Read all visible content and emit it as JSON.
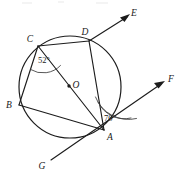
{
  "figure": {
    "shape": "circle",
    "center_label": "O",
    "points": [
      {
        "id": "A",
        "label": "A",
        "x": 104,
        "y": 130,
        "label_x": 110,
        "label_y": 140,
        "on_circle": true
      },
      {
        "id": "B",
        "label": "B",
        "x": 19,
        "y": 105,
        "label_x": 9,
        "label_y": 108,
        "on_circle": true
      },
      {
        "id": "C",
        "label": "C",
        "x": 38,
        "y": 46,
        "label_x": 30,
        "label_y": 42,
        "on_circle": true
      },
      {
        "id": "D",
        "label": "D",
        "x": 89,
        "y": 41,
        "label_x": 85,
        "label_y": 35,
        "on_circle": true
      },
      {
        "id": "O",
        "label": "O",
        "x": 69,
        "y": 86,
        "label_x": 74,
        "label_y": 85,
        "on_circle": false
      },
      {
        "id": "E",
        "label": "E",
        "x": 130,
        "y": 14,
        "label_x": 134,
        "label_y": 13,
        "on_circle": false
      },
      {
        "id": "F",
        "label": "F",
        "x": 164,
        "y": 81,
        "label_x": 170,
        "label_y": 79,
        "on_circle": false
      },
      {
        "id": "G",
        "label": "G",
        "x": 51,
        "y": 160,
        "label_x": 42,
        "label_y": 166,
        "on_circle": false
      }
    ],
    "circle": {
      "cx": 70,
      "cy": 87,
      "r": 51
    },
    "segments": [
      {
        "name": "chord-CD",
        "from": "C",
        "to": "D"
      },
      {
        "name": "chord-CB",
        "from": "C",
        "to": "B"
      },
      {
        "name": "chord-CA-diameter",
        "from": "C",
        "to": "A"
      },
      {
        "name": "chord-DA",
        "from": "D",
        "to": "A"
      },
      {
        "name": "chord-BA",
        "from": "B",
        "to": "A"
      }
    ],
    "rays": [
      {
        "name": "ray-D-to-E",
        "from": "D",
        "to": "E",
        "arrow": true
      },
      {
        "name": "ray-G-through-A-to-F",
        "from": "G",
        "to": "F",
        "arrow": true
      }
    ],
    "angles": [
      {
        "name": "angle-at-C",
        "vertex": "C",
        "value": "52",
        "unit": "°",
        "label": "52°",
        "label_x": 42,
        "label_y": 60,
        "arcs": 1
      },
      {
        "name": "angle-at-A",
        "vertex": "A",
        "value": "70",
        "unit": "°",
        "label": "70°",
        "label_x": 106,
        "label_y": 118,
        "arcs": 2
      }
    ],
    "colors": {
      "stroke": "#1c1c1c",
      "arc_stroke": "#3a3a3a",
      "background": "#ffffff",
      "label_color": "#1a1a1a"
    }
  }
}
